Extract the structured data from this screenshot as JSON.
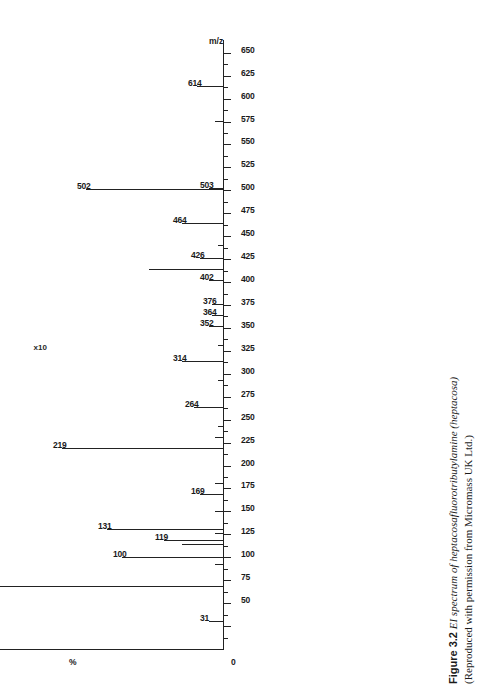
{
  "figure": {
    "number": "Figure 3.2",
    "title_italic": "EI spectrum of heptacosafluorotributylamine (heptacosa)",
    "credit": "(Reproduced with permission from Micromass UK Ltd.)"
  },
  "axes": {
    "x_title": "m/z",
    "y_title": "%",
    "y_top_label": "100",
    "y_bottom_label": "0",
    "scale_note": "x10",
    "x_tick_labels": [
      "50",
      "75",
      "100",
      "125",
      "150",
      "175",
      "200",
      "225",
      "250",
      "275",
      "300",
      "325",
      "350",
      "375",
      "400",
      "425",
      "450",
      "475",
      "500",
      "525",
      "550",
      "575",
      "600",
      "625",
      "650"
    ],
    "x_min": 0,
    "x_max": 665,
    "y_min": 0,
    "y_max": 100
  },
  "chart_data": {
    "type": "bar",
    "title": "EI spectrum of heptacosafluorotributylamine (heptacosa)",
    "xlabel": "m/z",
    "ylabel": "%",
    "xlim": [
      0,
      665
    ],
    "ylim": [
      0,
      100
    ],
    "grid": false,
    "legend": false,
    "orientation": "rotated-90ccw",
    "labelled_peaks": [
      {
        "mz": 31,
        "intensity": 5
      },
      {
        "mz": 69,
        "intensity": 100
      },
      {
        "mz": 100,
        "intensity": 34
      },
      {
        "mz": 119,
        "intensity": 20
      },
      {
        "mz": 131,
        "intensity": 39
      },
      {
        "mz": 169,
        "intensity": 8
      },
      {
        "mz": 219,
        "intensity": 54
      },
      {
        "mz": 264,
        "intensity": 10
      },
      {
        "mz": 314,
        "intensity": 14
      },
      {
        "mz": 352,
        "intensity": 5
      },
      {
        "mz": 364,
        "intensity": 4
      },
      {
        "mz": 376,
        "intensity": 4
      },
      {
        "mz": 402,
        "intensity": 5
      },
      {
        "mz": 426,
        "intensity": 8
      },
      {
        "mz": 464,
        "intensity": 14
      },
      {
        "mz": 502,
        "intensity": 46
      },
      {
        "mz": 503,
        "intensity": 5
      },
      {
        "mz": 614,
        "intensity": 9
      }
    ],
    "unlabelled_peaks": [
      {
        "mz": 93,
        "intensity": 3
      },
      {
        "mz": 114,
        "intensity": 14
      },
      {
        "mz": 127,
        "intensity": 3
      },
      {
        "mz": 150,
        "intensity": 3
      },
      {
        "mz": 181,
        "intensity": 3
      },
      {
        "mz": 231,
        "intensity": 3
      },
      {
        "mz": 243,
        "intensity": 2
      },
      {
        "mz": 293,
        "intensity": 2
      },
      {
        "mz": 331,
        "intensity": 2
      },
      {
        "mz": 414,
        "intensity": 25
      },
      {
        "mz": 440,
        "intensity": 2
      },
      {
        "mz": 576,
        "intensity": 3
      }
    ]
  }
}
